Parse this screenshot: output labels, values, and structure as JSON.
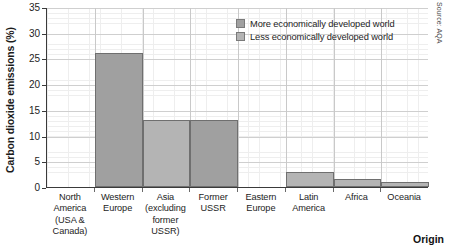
{
  "chart_data": {
    "type": "bar",
    "title": "",
    "xlabel": "Origin",
    "ylabel": "Carbon dioxide emissions (%)",
    "ylim": [
      0,
      35
    ],
    "yticks": [
      0,
      5,
      10,
      15,
      20,
      25,
      30,
      35
    ],
    "grid": true,
    "legend_position": "top-right",
    "categories": [
      "North America (USA & Canada)",
      "Western Europe",
      "Asia (excluding former USSR)",
      "Former USSR",
      "Eastern Europe",
      "Latin America",
      "Africa",
      "Oceania"
    ],
    "values": [
      0,
      26,
      13,
      13,
      0,
      3,
      1.5,
      1
    ],
    "point_groups": [
      "More economically developed world",
      "More economically developed world",
      "Less economically developed world",
      "More economically developed world",
      "More economically developed world",
      "Less economically developed world",
      "Less economically developed world",
      "Less economically developed world"
    ],
    "series": [
      {
        "name": "More economically developed world",
        "color": "#a0a0a0",
        "values": [
          0,
          26,
          null,
          13,
          0,
          null,
          null,
          null
        ]
      },
      {
        "name": "Less economically developed world",
        "color": "#b4b4b4",
        "values": [
          null,
          null,
          13,
          null,
          null,
          3,
          1.5,
          1
        ]
      }
    ]
  },
  "axes": {
    "y_title": "Carbon dioxide emissions (%)",
    "x_title": "Origin",
    "y_ticks": [
      "35",
      "30",
      "25",
      "20",
      "15",
      "10",
      "5",
      "0"
    ],
    "x_ticks": [
      {
        "lines": [
          "North",
          "America",
          "(USA &",
          "Canada)"
        ]
      },
      {
        "lines": [
          "Western",
          "Europe"
        ]
      },
      {
        "lines": [
          "Asia",
          "(excluding",
          "former",
          "USSR)"
        ]
      },
      {
        "lines": [
          "Former",
          "USSR"
        ]
      },
      {
        "lines": [
          "Eastern",
          "Europe"
        ]
      },
      {
        "lines": [
          "Latin",
          "America"
        ]
      },
      {
        "lines": [
          "Africa"
        ]
      },
      {
        "lines": [
          "Oceania"
        ]
      }
    ]
  },
  "legend": {
    "items": [
      {
        "label": "More economically developed world",
        "color": "#a0a0a0"
      },
      {
        "label": "Less economically developed world",
        "color": "#b4b4b4"
      }
    ]
  },
  "credit": {
    "text": "Source: AQA"
  },
  "colors": {
    "more_developed": "#a0a0a0",
    "less_developed": "#b4b4b4",
    "bar_edge": "#6f6f6f",
    "axis": "#3a3a3a",
    "gridline": "#cfcfcf",
    "minor_gridline": "#eeeeee",
    "text": "#1d1d1d"
  }
}
